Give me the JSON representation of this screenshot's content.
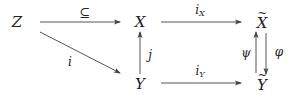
{
  "diagram": {
    "type": "commutative-diagram",
    "colors": {
      "ink": "#222222",
      "arrow": "#555555",
      "background": "#ffffff"
    },
    "nodes": {
      "Z": {
        "label": "Z"
      },
      "X": {
        "label": "X"
      },
      "Xtilde": {
        "label": "X",
        "decoration": "~"
      },
      "Y": {
        "label": "Y"
      },
      "Ytilde": {
        "label": "Y",
        "decoration": "~"
      }
    },
    "arrows": {
      "Z_to_X": {
        "label": "⊆",
        "from": "Z",
        "to": "X"
      },
      "Z_to_Y": {
        "label": "i",
        "from": "Z",
        "to": "Y"
      },
      "Y_to_X": {
        "label": "j",
        "from": "Y",
        "to": "X"
      },
      "X_to_Xtilde": {
        "label": "i",
        "subscript": "X",
        "from": "X",
        "to": "X̃"
      },
      "Y_to_Ytilde": {
        "label": "i",
        "subscript": "Y",
        "from": "Y",
        "to": "Ỹ"
      },
      "Ytilde_to_Xtilde": {
        "label": "ψ",
        "from": "Ỹ",
        "to": "X̃"
      },
      "Xtilde_to_Ytilde": {
        "label": "φ",
        "from": "X̃",
        "to": "Ỹ"
      }
    }
  }
}
